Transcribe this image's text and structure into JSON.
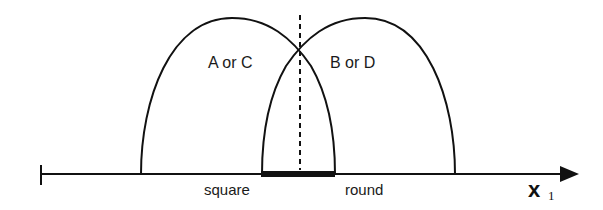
{
  "diagram": {
    "type": "overlapping class distributions on a 1-D feature axis",
    "axis": {
      "label_main": "x",
      "label_subscript": "1",
      "color": "#111111"
    },
    "curves": [
      {
        "id": "left",
        "label": "A or C"
      },
      {
        "id": "right",
        "label": "B or D"
      }
    ],
    "decision_boundary": {
      "style": "dashed"
    },
    "overlap_region": {
      "style": "thick bar"
    },
    "region_labels": {
      "left": "square",
      "right": "round"
    }
  }
}
